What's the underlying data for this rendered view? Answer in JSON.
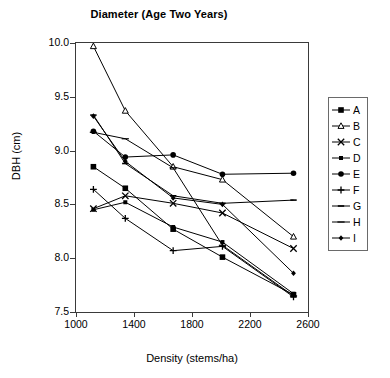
{
  "chart_data": {
    "type": "line",
    "title": "Diameter (Age Two Years)",
    "xlabel": "Density (stems/ha)",
    "ylabel": "DBH (cm)",
    "xlim": [
      1000,
      2600
    ],
    "ylim": [
      7.5,
      10.0
    ],
    "xticks": [
      1000,
      1400,
      1800,
      2200,
      2600
    ],
    "yticks": [
      "7.5",
      "8.0",
      "8.5",
      "9.0",
      "9.5",
      "10.0"
    ],
    "grid": false,
    "legend_position": "right-outside",
    "x": [
      1120,
      1340,
      1670,
      2010,
      2500
    ],
    "series": [
      {
        "name": "A",
        "marker": "filled-square",
        "values": [
          8.85,
          8.65,
          8.27,
          8.01,
          7.66
        ]
      },
      {
        "name": "B",
        "marker": "open-triangle",
        "values": [
          9.97,
          9.37,
          8.85,
          8.73,
          8.2
        ]
      },
      {
        "name": "C",
        "marker": "x-cross",
        "values": [
          8.46,
          8.58,
          8.51,
          8.42,
          8.09
        ]
      },
      {
        "name": "D",
        "marker": "small-filled-square",
        "values": [
          8.45,
          8.52,
          8.29,
          8.15,
          7.67
        ]
      },
      {
        "name": "E",
        "marker": "filled-circle",
        "values": [
          9.18,
          8.94,
          8.96,
          8.78,
          8.79
        ]
      },
      {
        "name": "F",
        "marker": "plus",
        "values": [
          8.64,
          8.37,
          8.07,
          8.11,
          7.64
        ]
      },
      {
        "name": "G",
        "marker": "dash",
        "values": [
          9.33,
          8.88,
          8.58,
          8.51,
          8.54
        ]
      },
      {
        "name": "H",
        "marker": "line",
        "values": [
          9.17,
          9.11,
          8.84,
          8.12,
          7.65
        ]
      },
      {
        "name": "I",
        "marker": "small-diamond",
        "values": [
          9.32,
          8.9,
          8.56,
          8.5,
          7.86
        ]
      }
    ]
  },
  "legend": {
    "items": [
      {
        "label": "A"
      },
      {
        "label": "B"
      },
      {
        "label": "C"
      },
      {
        "label": "D"
      },
      {
        "label": "E"
      },
      {
        "label": "F"
      },
      {
        "label": "G"
      },
      {
        "label": "H"
      },
      {
        "label": "I"
      }
    ]
  },
  "colors": {
    "line": "#000000",
    "axis": "#3a3a3a",
    "legend_border": "#6a6a6a",
    "background": "#ffffff"
  }
}
